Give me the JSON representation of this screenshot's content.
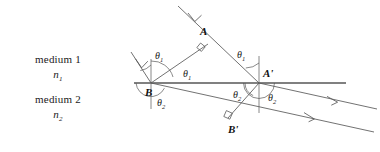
{
  "figure": {
    "colors": {
      "ray": "#555555",
      "interface": "#808080",
      "normal": "#666666",
      "text": "#111111",
      "background": "#ffffff"
    }
  },
  "media": [
    {
      "id": "medium-1",
      "name": "medium 1",
      "index_symbol": "n",
      "index_subscript": "1"
    },
    {
      "id": "medium-2",
      "name": "medium 2",
      "index_symbol": "n",
      "index_subscript": "2"
    }
  ],
  "points": [
    {
      "id": "A",
      "label": "A",
      "x": 203,
      "y": 33
    },
    {
      "id": "B",
      "label": "B",
      "x": 151,
      "y": 94
    },
    {
      "id": "Ap",
      "label": "A'",
      "x": 265,
      "y": 75
    },
    {
      "id": "Bp",
      "label": "B'",
      "x": 235,
      "y": 122
    }
  ],
  "angles": [
    {
      "id": "theta1-at-B-incident",
      "symbol": "θ",
      "subscript": "1",
      "x": 155,
      "y": 51
    },
    {
      "id": "theta1-at-B-wavefront",
      "symbol": "θ",
      "subscript": "1",
      "x": 187,
      "y": 68
    },
    {
      "id": "theta1-at-Ap",
      "symbol": "θ",
      "subscript": "1",
      "x": 240,
      "y": 50
    },
    {
      "id": "theta2-at-B",
      "symbol": "θ",
      "subscript": "2",
      "x": 159,
      "y": 99
    },
    {
      "id": "theta2-at-Ap-left",
      "symbol": "θ",
      "subscript": "2",
      "x": 237,
      "y": 92
    },
    {
      "id": "theta2-at-Ap-right",
      "symbol": "θ",
      "subscript": "2",
      "x": 272,
      "y": 95
    }
  ],
  "geometry": {
    "interface": {
      "x1": 134,
      "y1": 83,
      "x2": 346,
      "y2": 83
    },
    "normals": [
      {
        "id": "normal-at-B",
        "x1": 151,
        "y1": 60,
        "x2": 151,
        "y2": 108
      },
      {
        "id": "normal-at-Ap",
        "x1": 259,
        "y1": 57,
        "x2": 259,
        "y2": 112
      }
    ],
    "incident_rays": [
      {
        "id": "incident-ray-upper",
        "x1": 178,
        "y1": 6,
        "x2": 259,
        "y2": 83,
        "arrow_at": 0.22
      },
      {
        "id": "incident-ray-lower",
        "x1": 133,
        "y1": 53,
        "x2": 151,
        "y2": 83,
        "arrow_at": 0.34
      }
    ],
    "wavefront_incident": {
      "id": "wavefront-AB",
      "x1": 151,
      "y1": 83,
      "x2": 207,
      "y2": 45
    },
    "refracted_rays": [
      {
        "id": "refracted-ray-upper",
        "x1": 151,
        "y1": 83,
        "x2": 372,
        "y2": 131,
        "arrow_at": 0.72
      },
      {
        "id": "refracted-ray-lower",
        "x1": 259,
        "y1": 83,
        "x2": 375,
        "y2": 108,
        "arrow_at": 0.66
      }
    ],
    "wavefront_refracted": {
      "id": "wavefront-ApBp",
      "x1": 259,
      "y1": 83,
      "x2": 229,
      "y2": 117
    },
    "right_angles": [
      {
        "id": "right-angle-at-A",
        "x": 200,
        "y": 47
      },
      {
        "id": "right-angle-at-Bp",
        "x": 230,
        "y": 114
      }
    ]
  }
}
